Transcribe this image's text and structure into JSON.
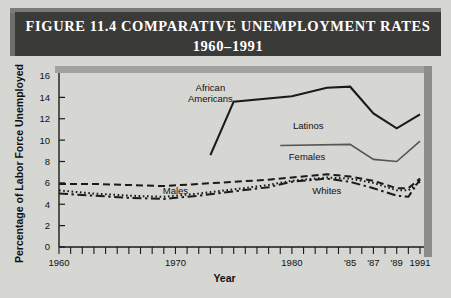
{
  "figure": {
    "title_line1": "FIGURE 11.4   COMPARATIVE UNEMPLOYMENT RATES",
    "title_line2": "1960–1991"
  },
  "chart_data": {
    "type": "line",
    "xlabel": "Year",
    "ylabel": "Percentage of Labor Force Unemployed",
    "xlim": [
      1960,
      1991
    ],
    "ylim": [
      0,
      16
    ],
    "yticks": [
      0,
      2,
      4,
      6,
      8,
      10,
      12,
      14,
      16
    ],
    "ytick_labels": [
      "0",
      "2",
      "4",
      "6",
      "8",
      "10",
      "12",
      "14",
      "16"
    ],
    "xticks": [
      1960,
      1961,
      1962,
      1963,
      1964,
      1965,
      1966,
      1967,
      1968,
      1969,
      1970,
      1971,
      1972,
      1973,
      1974,
      1975,
      1976,
      1977,
      1978,
      1979,
      1980,
      1981,
      1982,
      1983,
      1984,
      1985,
      1986,
      1987,
      1988,
      1989,
      1990,
      1991
    ],
    "xtick_labels": [
      {
        "x": 1960,
        "label": "1960"
      },
      {
        "x": 1970,
        "label": "1970"
      },
      {
        "x": 1980,
        "label": "1980"
      },
      {
        "x": 1985,
        "label": "'85"
      },
      {
        "x": 1987,
        "label": "'87"
      },
      {
        "x": 1989,
        "label": "'89"
      },
      {
        "x": 1991,
        "label": "1991"
      }
    ],
    "grid": false,
    "legend": "inline-labels",
    "series": [
      {
        "name": "African Americans",
        "style": "solid",
        "color": "#1a1a1a",
        "width": 2.1,
        "label_pos": {
          "x": 1973.0,
          "y": 14.6
        },
        "x": [
          1973,
          1975,
          1980,
          1983,
          1985,
          1987,
          1989,
          1991
        ],
        "values": [
          8.6,
          13.6,
          14.1,
          14.9,
          15.0,
          12.5,
          11.1,
          12.4
        ]
      },
      {
        "name": "Latinos",
        "style": "solid",
        "color": "#555553",
        "width": 1.6,
        "label_pos": {
          "x": 1981.4,
          "y": 11.0
        },
        "x": [
          1979,
          1985,
          1987,
          1989,
          1991
        ],
        "values": [
          9.5,
          9.6,
          8.2,
          8.0,
          9.9
        ]
      },
      {
        "name": "Females",
        "style": "dashed",
        "color": "#1a1a1a",
        "width": 2.0,
        "label_pos": {
          "x": 1981.3,
          "y": 8.1
        },
        "x": [
          1960,
          1963,
          1966,
          1969,
          1972,
          1975,
          1978,
          1980,
          1983,
          1985,
          1987,
          1989,
          1990,
          1991
        ],
        "values": [
          5.9,
          5.9,
          5.8,
          5.7,
          5.9,
          6.1,
          6.3,
          6.5,
          6.8,
          6.6,
          6.2,
          5.5,
          5.5,
          6.4
        ]
      },
      {
        "name": "Whites",
        "style": "dotted",
        "color": "#1a1a1a",
        "width": 2.0,
        "label_pos": {
          "x": 1983.0,
          "y": 5.0
        },
        "x": [
          1960,
          1963,
          1966,
          1969,
          1972,
          1975,
          1978,
          1980,
          1983,
          1985,
          1987,
          1989,
          1990,
          1991
        ],
        "values": [
          5.3,
          5.0,
          4.8,
          4.7,
          5.0,
          5.4,
          5.8,
          6.2,
          6.5,
          6.4,
          6.0,
          5.3,
          5.3,
          6.1
        ]
      },
      {
        "name": "Males",
        "style": "dashdot",
        "color": "#1a1a1a",
        "width": 2.0,
        "label_pos": {
          "x": 1970.0,
          "y": 5.0
        },
        "x": [
          1960,
          1963,
          1966,
          1969,
          1972,
          1975,
          1978,
          1980,
          1983,
          1985,
          1987,
          1989,
          1990,
          1991
        ],
        "values": [
          5.0,
          4.8,
          4.6,
          4.5,
          4.8,
          5.2,
          5.6,
          6.1,
          6.4,
          6.1,
          5.5,
          4.8,
          4.7,
          6.3
        ]
      }
    ]
  }
}
